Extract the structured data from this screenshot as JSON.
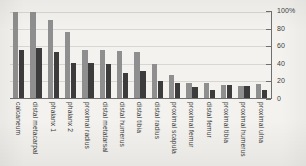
{
  "chart_data": {
    "type": "bar",
    "title": "",
    "xlabel": "",
    "ylabel": "",
    "ylim": [
      0,
      100
    ],
    "grid": true,
    "legend_position": "none",
    "y_ticks": [
      "0",
      "20",
      "40",
      "60",
      "80",
      "100%"
    ],
    "y_tick_values": [
      0,
      20,
      40,
      60,
      80,
      100
    ],
    "categories": [
      "calcaneum",
      "distal metacarpal",
      "phalanx 1",
      "phalanx 2",
      "proximal radius",
      "distal metatarsal",
      "distal humerus",
      "distal tibia",
      "distal radius",
      "proximal scapula",
      "proximal femur",
      "distal femur",
      "proximal tibia",
      "proximal humerus",
      "proximal ulna"
    ],
    "series": [
      {
        "name": "series-1",
        "color": "#8f8f8f",
        "values": [
          100,
          100,
          91,
          77,
          56,
          56,
          55,
          54,
          40,
          27,
          17,
          17,
          15,
          14,
          16
        ]
      },
      {
        "name": "series-2",
        "color": "#3c3c3c",
        "values": [
          56,
          58,
          53,
          41,
          41,
          39,
          29,
          31,
          20,
          18,
          13,
          9,
          15,
          14,
          9
        ]
      }
    ]
  },
  "style": {
    "background": "#f3f2ef",
    "grid_color": "#d8d6d2",
    "axis_color": "#6f6f6f",
    "text_color": "#3a3a3a"
  }
}
